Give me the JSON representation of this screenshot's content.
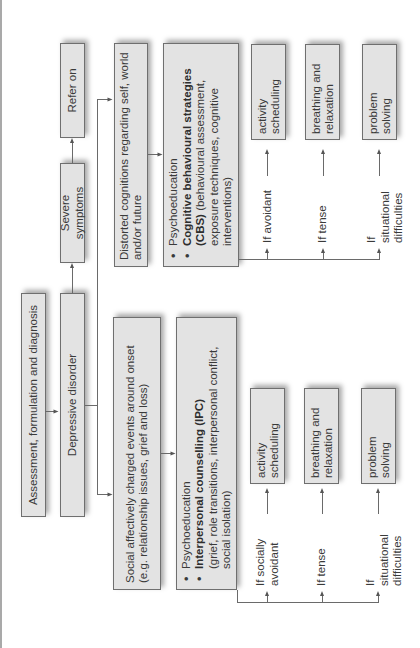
{
  "diagram": {
    "orientation": "rotated-90-ccw",
    "colors": {
      "box_fill": "#e3e3e3",
      "box_border": "#6f6f6f",
      "line": "#6a6a6a",
      "text": "#3a3a3a"
    },
    "nodes": {
      "assessment": "Assessment, formulation and diagnosis",
      "depressive_disorder": "Depressive disorder",
      "severe_symptoms": "Severe symptoms",
      "refer_on": "Refer on",
      "social_events": "Social affectively charged events around onset (e.g. relationship issues, grief and loss)",
      "distorted_cognitions": "Distorted cognitions regarding self, world and/or future",
      "ipc": {
        "bullet1": "Psychoeducation",
        "bullet2_bold": "Interpersonal counselling (IPC)",
        "bullet2_rest": "(grief, role transitions, interpersonal conflict, social isolation)"
      },
      "cbs": {
        "bullet1": "Psychoeducation",
        "bullet2_bold": "Cognitive behavioural strategies (CBS)",
        "bullet2_rest": " (behavioural assessment, exposure techniques, cognitive interventions)"
      },
      "ipc_branch": {
        "conditions": [
          "If socially avoidant",
          "If tense",
          "If situational difficulties"
        ],
        "actions": [
          "activity scheduling",
          "breathing and relaxation",
          "problem solving"
        ]
      },
      "cbs_branch": {
        "conditions": [
          "If avoidant",
          "If tense",
          "If situational difficulties"
        ],
        "actions": [
          "activity scheduling",
          "breathing and relaxation",
          "problem solving"
        ]
      }
    }
  }
}
